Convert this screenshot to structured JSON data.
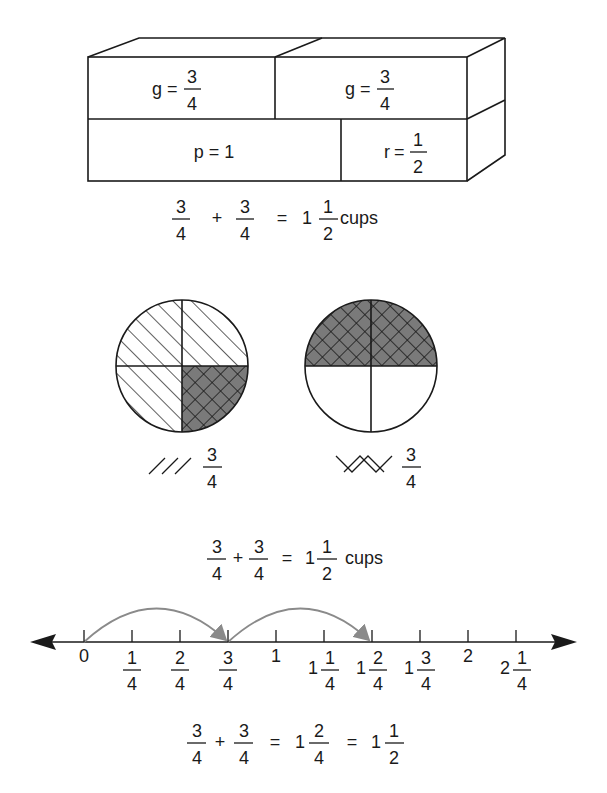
{
  "box_model": {
    "top_left": {
      "var": "g",
      "eq": "=",
      "num": "3",
      "den": "4"
    },
    "top_right": {
      "var": "g",
      "eq": "=",
      "num": "3",
      "den": "4"
    },
    "bottom_left": {
      "text": "p = 1"
    },
    "bottom_right": {
      "var": "r",
      "eq": "=",
      "num": "1",
      "den": "2"
    },
    "equation": {
      "a_num": "3",
      "a_den": "4",
      "plus": "+",
      "b_num": "3",
      "b_den": "4",
      "eq": "=",
      "whole": "1",
      "r_num": "1",
      "r_den": "2",
      "unit": "cups"
    }
  },
  "circle_model": {
    "left_circle": {
      "pattern": "diagonal-hatch",
      "shaded_quarters": 3,
      "overlap_quarter": "bottom-right"
    },
    "right_circle": {
      "pattern": "crosshatch",
      "shaded_quarters": 2
    },
    "legend": [
      {
        "pattern": "diagonal-hatch",
        "num": "3",
        "den": "4"
      },
      {
        "pattern": "crosshatch",
        "num": "3",
        "den": "4"
      }
    ],
    "equation": {
      "a_num": "3",
      "a_den": "4",
      "plus": "+",
      "b_num": "3",
      "b_den": "4",
      "eq": "=",
      "whole": "1",
      "r_num": "1",
      "r_den": "2",
      "unit": "cups"
    }
  },
  "number_line": {
    "ticks": [
      {
        "whole": "0",
        "num": "",
        "den": ""
      },
      {
        "whole": "",
        "num": "1",
        "den": "4"
      },
      {
        "whole": "",
        "num": "2",
        "den": "4"
      },
      {
        "whole": "",
        "num": "3",
        "den": "4"
      },
      {
        "whole": "1",
        "num": "",
        "den": ""
      },
      {
        "whole": "1",
        "num": "1",
        "den": "4"
      },
      {
        "whole": "1",
        "num": "2",
        "den": "4"
      },
      {
        "whole": "1",
        "num": "3",
        "den": "4"
      },
      {
        "whole": "2",
        "num": "",
        "den": ""
      },
      {
        "whole": "2",
        "num": "1",
        "den": "4"
      }
    ],
    "jumps": [
      {
        "from": "0",
        "to": "3/4"
      },
      {
        "from": "3/4",
        "to": "1 2/4"
      }
    ],
    "equation": {
      "a_num": "3",
      "a_den": "4",
      "plus": "+",
      "b_num": "3",
      "b_den": "4",
      "eq1": "=",
      "w1": "1",
      "f1_num": "2",
      "f1_den": "4",
      "eq2": "=",
      "w2": "1",
      "f2_num": "1",
      "f2_den": "2"
    }
  },
  "colors": {
    "ink": "#1a1a1a",
    "shade": "#7a7a7a",
    "arrow": "#8a8a8a"
  }
}
